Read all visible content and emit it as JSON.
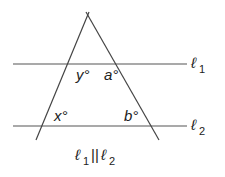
{
  "diagram": {
    "lines": [
      {
        "name": "ℓ1",
        "label_main": "ℓ",
        "label_sub": "1"
      },
      {
        "name": "ℓ2",
        "label_main": "ℓ",
        "label_sub": "2"
      }
    ],
    "angles": {
      "y": "y°",
      "a": "a°",
      "x": "x°",
      "b": "b°"
    },
    "caption": {
      "l1": "ℓ",
      "s1": "1",
      "par": "||",
      "l2": "ℓ",
      "s2": "2"
    },
    "colors": {
      "stroke": "#444444",
      "text": "#222222"
    }
  }
}
